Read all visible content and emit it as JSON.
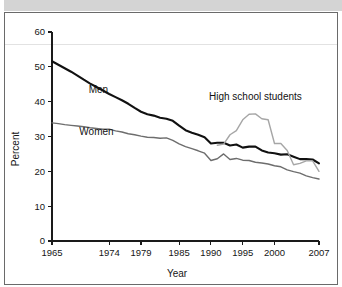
{
  "figure": {
    "top_band_color": "#d4d4d4",
    "frame_color": "#6a6a6a",
    "background": "#ffffff"
  },
  "chart_data": {
    "type": "line",
    "title": "",
    "xlabel": "Year",
    "ylabel": "Percent",
    "xlim": [
      1965,
      2007
    ],
    "ylim": [
      0,
      60
    ],
    "yticks": [
      0,
      10,
      20,
      30,
      40,
      50,
      60
    ],
    "ytick_labels": [
      "0",
      "10",
      "20",
      "30",
      "40",
      "50",
      "60"
    ],
    "xticks": [
      1965,
      1974,
      1979,
      1985,
      1990,
      1995,
      2000,
      2007
    ],
    "xtick_labels": [
      "1965",
      "1974",
      "1979",
      "1985",
      "1990",
      "1995",
      "2000",
      "2007"
    ],
    "grid": false,
    "legend_position": "inline-annotations",
    "series": [
      {
        "name": "Men",
        "color": "#111111",
        "width": 2.1,
        "label_x": 1972.3,
        "label_y": 42.6,
        "x": [
          1965,
          1966,
          1967,
          1968,
          1969,
          1970,
          1971,
          1972,
          1973,
          1974,
          1975,
          1976,
          1977,
          1978,
          1979,
          1980,
          1981,
          1982,
          1983,
          1984,
          1985,
          1986,
          1987,
          1988,
          1989,
          1990,
          1991,
          1992,
          1993,
          1994,
          1995,
          1996,
          1997,
          1998,
          1999,
          2000,
          2001,
          2002,
          2003,
          2004,
          2005,
          2006,
          2007
        ],
        "values": [
          51.6,
          50.6,
          49.6,
          48.6,
          47.5,
          46.3,
          45.2,
          44.2,
          43.2,
          42.2,
          41.3,
          40.4,
          39.4,
          38.2,
          37.1,
          36.4,
          36.0,
          35.4,
          35.1,
          34.5,
          33.1,
          31.8,
          31.1,
          30.5,
          29.8,
          28.0,
          28.2,
          28.2,
          27.4,
          27.7,
          26.8,
          27.1,
          27.1,
          26.0,
          25.4,
          25.2,
          24.8,
          24.9,
          24.2,
          23.5,
          23.5,
          23.4,
          22.3
        ]
      },
      {
        "name": "Women",
        "color": "#6d6d6d",
        "width": 1.4,
        "label_x": 1972.0,
        "label_y": 30.5,
        "x": [
          1965,
          1966,
          1967,
          1968,
          1969,
          1970,
          1971,
          1972,
          1973,
          1974,
          1975,
          1976,
          1977,
          1978,
          1979,
          1980,
          1981,
          1982,
          1983,
          1984,
          1985,
          1986,
          1987,
          1988,
          1989,
          1990,
          1991,
          1992,
          1993,
          1994,
          1995,
          1996,
          1997,
          1998,
          1999,
          2000,
          2001,
          2002,
          2003,
          2004,
          2005,
          2006,
          2007
        ],
        "values": [
          33.9,
          33.7,
          33.4,
          33.2,
          33.0,
          32.8,
          32.5,
          32.3,
          32.1,
          32.1,
          31.6,
          31.3,
          30.8,
          30.5,
          30.1,
          29.8,
          29.7,
          29.5,
          29.6,
          28.9,
          27.9,
          27.1,
          26.5,
          25.9,
          25.2,
          23.1,
          23.6,
          25.0,
          23.4,
          23.7,
          23.2,
          23.1,
          22.6,
          22.4,
          22.1,
          21.6,
          21.3,
          20.4,
          19.9,
          19.5,
          18.7,
          18.2,
          17.8
        ]
      },
      {
        "name": "High school students",
        "color": "#a6a6a6",
        "width": 1.4,
        "label_x": 1997.0,
        "label_y": 40.6,
        "x": [
          1991,
          1992,
          1993,
          1994,
          1995,
          1996,
          1997,
          1998,
          1999,
          2000,
          2001,
          2002,
          2003,
          2004,
          2005,
          2006,
          2007
        ],
        "values": [
          27.5,
          27.8,
          30.5,
          31.7,
          34.8,
          36.4,
          36.5,
          35.1,
          34.8,
          28.0,
          28.0,
          26.0,
          21.9,
          22.3,
          23.0,
          23.0,
          20.0
        ]
      }
    ]
  },
  "annotations": {
    "men_label": "Men",
    "women_label": "Women",
    "high_school_label": "High school students"
  },
  "axes": {
    "y_title": "Percent",
    "x_title": "Year"
  }
}
